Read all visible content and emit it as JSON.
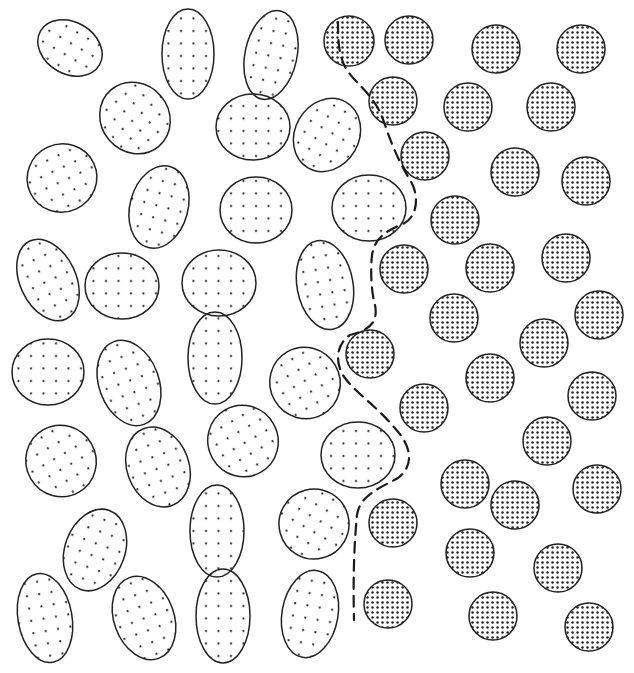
{
  "diagram": {
    "colors": {
      "background": "#ffffff",
      "stroke": "#222222",
      "dot": "#222222",
      "boundary": "#1a1a1a"
    },
    "boundary": {
      "style": "dashed",
      "path": "M 338 22 C 338 50, 340 65, 355 80 C 375 100, 380 110, 385 125 C 392 145, 398 160, 410 180 C 420 195, 418 220, 400 225 C 385 232, 375 238, 372 255 C 370 275, 372 295, 375 305 C 378 320, 372 330, 350 335 C 335 345, 335 365, 345 378 C 355 392, 375 405, 392 425 C 412 445, 415 465, 398 478 C 380 488, 360 495, 357 515 C 354 545, 353 580, 354 620"
    },
    "ellipses": [
      {
        "cx": 70,
        "cy": 48,
        "rx": 34,
        "ry": 26,
        "rot": 30
      },
      {
        "cx": 188,
        "cy": 54,
        "rx": 26,
        "ry": 45,
        "rot": 0
      },
      {
        "cx": 271,
        "cy": 55,
        "rx": 26,
        "ry": 45,
        "rot": 12
      },
      {
        "cx": 135,
        "cy": 118,
        "rx": 34,
        "ry": 37,
        "rot": -40
      },
      {
        "cx": 253,
        "cy": 127,
        "rx": 37,
        "ry": 33,
        "rot": 0
      },
      {
        "cx": 327,
        "cy": 135,
        "rx": 32,
        "ry": 38,
        "rot": 30
      },
      {
        "cx": 62,
        "cy": 178,
        "rx": 35,
        "ry": 34,
        "rot": -25
      },
      {
        "cx": 159,
        "cy": 207,
        "rx": 29,
        "ry": 42,
        "rot": 15
      },
      {
        "cx": 256,
        "cy": 210,
        "rx": 36,
        "ry": 33,
        "rot": 0
      },
      {
        "cx": 369,
        "cy": 208,
        "rx": 37,
        "ry": 33,
        "rot": 0
      },
      {
        "cx": 48,
        "cy": 280,
        "rx": 28,
        "ry": 43,
        "rot": -25
      },
      {
        "cx": 122,
        "cy": 286,
        "rx": 37,
        "ry": 33,
        "rot": 0
      },
      {
        "cx": 219,
        "cy": 283,
        "rx": 37,
        "ry": 33,
        "rot": 0
      },
      {
        "cx": 325,
        "cy": 285,
        "rx": 28,
        "ry": 45,
        "rot": -10
      },
      {
        "cx": 48,
        "cy": 372,
        "rx": 36,
        "ry": 33,
        "rot": 0
      },
      {
        "cx": 129,
        "cy": 383,
        "rx": 30,
        "ry": 44,
        "rot": -20
      },
      {
        "cx": 215,
        "cy": 358,
        "rx": 27,
        "ry": 46,
        "rot": 0
      },
      {
        "cx": 305,
        "cy": 383,
        "rx": 35,
        "ry": 36,
        "rot": -30
      },
      {
        "cx": 61,
        "cy": 461,
        "rx": 35,
        "ry": 36,
        "rot": -30
      },
      {
        "cx": 158,
        "cy": 467,
        "rx": 31,
        "ry": 41,
        "rot": -20
      },
      {
        "cx": 243,
        "cy": 441,
        "rx": 35,
        "ry": 36,
        "rot": -30
      },
      {
        "cx": 358,
        "cy": 455,
        "rx": 37,
        "ry": 33,
        "rot": 0
      },
      {
        "cx": 95,
        "cy": 550,
        "rx": 30,
        "ry": 42,
        "rot": 20
      },
      {
        "cx": 217,
        "cy": 531,
        "rx": 27,
        "ry": 46,
        "rot": 0
      },
      {
        "cx": 314,
        "cy": 524,
        "rx": 35,
        "ry": 35,
        "rot": 30
      },
      {
        "cx": 45,
        "cy": 618,
        "rx": 27,
        "ry": 45,
        "rot": -10
      },
      {
        "cx": 144,
        "cy": 618,
        "rx": 30,
        "ry": 43,
        "rot": -20
      },
      {
        "cx": 223,
        "cy": 616,
        "rx": 27,
        "ry": 47,
        "rot": 0
      },
      {
        "cx": 310,
        "cy": 614,
        "rx": 28,
        "ry": 44,
        "rot": 10
      }
    ],
    "circles": [
      {
        "cx": 349,
        "cy": 41,
        "r": 25
      },
      {
        "cx": 409,
        "cy": 40,
        "r": 24
      },
      {
        "cx": 496,
        "cy": 49,
        "r": 24
      },
      {
        "cx": 581,
        "cy": 49,
        "r": 24
      },
      {
        "cx": 393,
        "cy": 101,
        "r": 24
      },
      {
        "cx": 468,
        "cy": 107,
        "r": 24
      },
      {
        "cx": 551,
        "cy": 107,
        "r": 24
      },
      {
        "cx": 425,
        "cy": 156,
        "r": 24
      },
      {
        "cx": 515,
        "cy": 172,
        "r": 24
      },
      {
        "cx": 586,
        "cy": 181,
        "r": 24
      },
      {
        "cx": 455,
        "cy": 220,
        "r": 24
      },
      {
        "cx": 404,
        "cy": 269,
        "r": 24
      },
      {
        "cx": 490,
        "cy": 268,
        "r": 24
      },
      {
        "cx": 566,
        "cy": 258,
        "r": 24
      },
      {
        "cx": 454,
        "cy": 318,
        "r": 24
      },
      {
        "cx": 599,
        "cy": 315,
        "r": 24
      },
      {
        "cx": 544,
        "cy": 343,
        "r": 24
      },
      {
        "cx": 370,
        "cy": 354,
        "r": 24
      },
      {
        "cx": 490,
        "cy": 378,
        "r": 24
      },
      {
        "cx": 592,
        "cy": 396,
        "r": 24
      },
      {
        "cx": 424,
        "cy": 408,
        "r": 24
      },
      {
        "cx": 547,
        "cy": 441,
        "r": 24
      },
      {
        "cx": 465,
        "cy": 484,
        "r": 24
      },
      {
        "cx": 515,
        "cy": 505,
        "r": 24
      },
      {
        "cx": 597,
        "cy": 489,
        "r": 24
      },
      {
        "cx": 393,
        "cy": 523,
        "r": 24
      },
      {
        "cx": 470,
        "cy": 553,
        "r": 24
      },
      {
        "cx": 558,
        "cy": 568,
        "r": 24
      },
      {
        "cx": 388,
        "cy": 604,
        "r": 24
      },
      {
        "cx": 493,
        "cy": 616,
        "r": 24
      },
      {
        "cx": 589,
        "cy": 627,
        "r": 24
      }
    ]
  }
}
